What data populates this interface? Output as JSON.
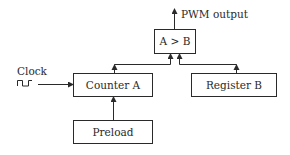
{
  "diagram": {
    "type": "block-diagram",
    "blocks": {
      "comparator": {
        "label": "A > B"
      },
      "counter": {
        "label": "Counter A"
      },
      "register": {
        "label": "Register B"
      },
      "preload": {
        "label": "Preload"
      }
    },
    "inputs": {
      "clock": {
        "label": "Clock"
      }
    },
    "outputs": {
      "pwm": {
        "label": "PWM output"
      }
    },
    "connections": [
      {
        "from": "clock",
        "to": "counter"
      },
      {
        "from": "preload",
        "to": "counter"
      },
      {
        "from": "counter",
        "to": "comparator"
      },
      {
        "from": "register",
        "to": "comparator"
      },
      {
        "from": "comparator",
        "to": "pwm"
      }
    ],
    "colors": {
      "stroke": "#2a2a2a",
      "background": "#ffffff"
    }
  }
}
